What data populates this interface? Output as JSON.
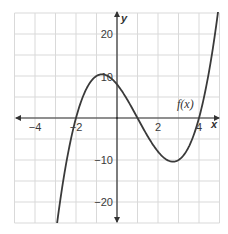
{
  "chart_data": {
    "type": "line",
    "title": "",
    "xlabel": "x",
    "ylabel": "y",
    "xlim": [
      -5,
      5
    ],
    "ylim": [
      -25,
      25
    ],
    "grid": true,
    "grid_step": {
      "x": 1,
      "y": 5
    },
    "x_ticks": [
      {
        "value": -4,
        "label": "−4"
      },
      {
        "value": -2,
        "label": "−2"
      },
      {
        "value": 2,
        "label": "2"
      },
      {
        "value": 4,
        "label": "4"
      }
    ],
    "y_ticks": [
      {
        "value": 20,
        "label": "20"
      },
      {
        "value": 10,
        "label": "10"
      },
      {
        "value": -10,
        "label": "−10"
      },
      {
        "value": -20,
        "label": "−20"
      }
    ],
    "series": [
      {
        "name": "f(x)",
        "expression": "(x+2)(x-1)(x-4)",
        "coefficients": [
          1,
          -3,
          -6,
          8
        ],
        "x_range": [
          -3,
          5
        ],
        "roots": [
          -2,
          1,
          4
        ],
        "y_intercept": 8,
        "local_max": {
          "x": -0.73,
          "y": 10.4
        },
        "local_min": {
          "x": 2.73,
          "y": -10.4
        },
        "points": [
          {
            "x": -2.9,
            "y": -24.1
          },
          {
            "x": -2.5,
            "y": -11.4
          },
          {
            "x": -2,
            "y": 0
          },
          {
            "x": -1.5,
            "y": 7.1
          },
          {
            "x": -1,
            "y": 10
          },
          {
            "x": -0.73,
            "y": 10.4
          },
          {
            "x": 0,
            "y": 8
          },
          {
            "x": 0.5,
            "y": 4.4
          },
          {
            "x": 1,
            "y": 0
          },
          {
            "x": 1.5,
            "y": -4.4
          },
          {
            "x": 2,
            "y": -8
          },
          {
            "x": 2.73,
            "y": -10.4
          },
          {
            "x": 3,
            "y": -10
          },
          {
            "x": 3.5,
            "y": -7.1
          },
          {
            "x": 4,
            "y": 0
          },
          {
            "x": 4.5,
            "y": 11.4
          },
          {
            "x": 4.8,
            "y": 21.6
          }
        ]
      }
    ],
    "annotations": [
      {
        "text": "f(x)",
        "x": 3.35,
        "y": 4
      }
    ]
  },
  "labels": {
    "x_axis": "x",
    "y_axis": "y",
    "function": "f(x)",
    "x_ticks": [
      "−4",
      "−2",
      "2",
      "4"
    ],
    "y_ticks": [
      "20",
      "10",
      "−10",
      "−20"
    ]
  },
  "colors": {
    "grid": "#d9d9d9",
    "axis": "#333333",
    "curve": "#3a3a3a",
    "background": "#ffffff"
  }
}
